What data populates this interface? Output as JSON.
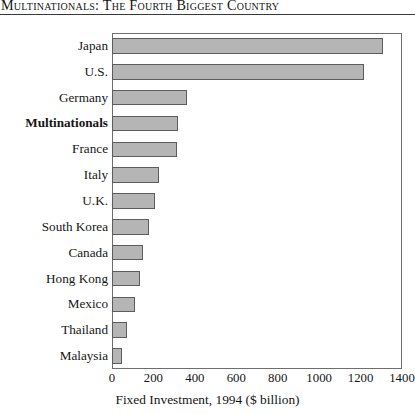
{
  "header": {
    "title": "Multinationals: The Fourth Biggest Country"
  },
  "chart_data": {
    "type": "bar",
    "orientation": "horizontal",
    "title": "Multinationals: The Fourth Biggest Country",
    "xlabel": "Fixed Investment, 1994 ($ billion)",
    "ylabel": "",
    "xlim": [
      0,
      1400
    ],
    "xticks": [
      0,
      200,
      400,
      600,
      800,
      1000,
      1200,
      1400
    ],
    "grid": false,
    "legend": false,
    "bar_fill": "#b5b5b5",
    "bar_border": "#5d5d5d",
    "highlight_category": "Multinationals",
    "categories": [
      "Japan",
      "U.S.",
      "Germany",
      "Multinationals",
      "France",
      "Italy",
      "U.K.",
      "South Korea",
      "Canada",
      "Hong Kong",
      "Mexico",
      "Thailand",
      "Malaysia"
    ],
    "values": [
      1310,
      1215,
      360,
      320,
      312,
      228,
      208,
      180,
      152,
      135,
      112,
      72,
      48
    ]
  }
}
